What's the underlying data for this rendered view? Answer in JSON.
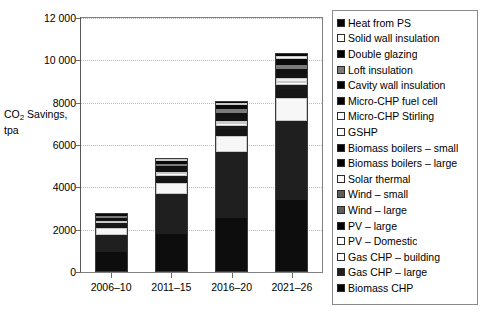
{
  "chart_data": {
    "type": "bar",
    "subtype": "stacked-bar",
    "title": "",
    "xlabel": "",
    "ylabel": "CO2 Savings, tpa",
    "ylabel_display": "CO₂ Savings,\ntpa",
    "ylim": [
      0,
      12000
    ],
    "yticks": [
      0,
      2000,
      4000,
      6000,
      8000,
      10000,
      12000
    ],
    "ytick_labels": [
      "0",
      "2000",
      "4000",
      "6000",
      "8000",
      "10 000",
      "12 000"
    ],
    "grid": true,
    "grid_axis": "y",
    "legend_position": "right",
    "categories": [
      "2006–10",
      "2011–15",
      "2016–20",
      "2021–26"
    ],
    "stack_order_bottom_to_top": [
      "Biomass CHP",
      "Gas CHP – large",
      "Gas CHP – building",
      "PV – Domestic",
      "PV – large",
      "Wind – large",
      "Wind – small",
      "Solar thermal",
      "Biomass boilers – large",
      "Biomass boilers – small",
      "GSHP",
      "Micro-CHP Stirling",
      "Micro-CHP fuel cell",
      "Cavity wall insulation",
      "Loft insulation",
      "Double glazing",
      "Solid wall insulation",
      "Heat from PS"
    ],
    "series": [
      {
        "name": "Biomass CHP",
        "color": "#0d0d0d",
        "values": [
          880,
          1750,
          2520,
          3340
        ]
      },
      {
        "name": "Gas CHP – large",
        "color": "#1f1f1f",
        "values": [
          840,
          1870,
          3100,
          3760
        ]
      },
      {
        "name": "Gas CHP – building",
        "color": "#f2f2f2",
        "values": [
          0,
          0,
          0,
          0
        ]
      },
      {
        "name": "PV – Domestic",
        "color": "#fbfbfb",
        "values": [
          0,
          0,
          0,
          0
        ]
      },
      {
        "name": "PV – large",
        "color": "#141414",
        "values": [
          0,
          0,
          0,
          0
        ]
      },
      {
        "name": "Wind – large",
        "color": "#5e5e5e",
        "values": [
          0,
          0,
          0,
          0
        ]
      },
      {
        "name": "Wind – small",
        "color": "#6b6b6b",
        "values": [
          0,
          0,
          0,
          0
        ]
      },
      {
        "name": "Solar thermal",
        "color": "#f7f7f7",
        "values": [
          320,
          520,
          760,
          1080
        ]
      },
      {
        "name": "Biomass boilers – large",
        "color": "#151515",
        "values": [
          150,
          260,
          330,
          430
        ]
      },
      {
        "name": "Biomass boilers – small",
        "color": "#191919",
        "values": [
          60,
          110,
          150,
          180
        ]
      },
      {
        "name": "GSHP",
        "color": "#fafafa",
        "values": [
          60,
          100,
          130,
          160
        ]
      },
      {
        "name": "Micro-CHP Stirling",
        "color": "#ededed",
        "values": [
          50,
          90,
          120,
          150
        ]
      },
      {
        "name": "Micro-CHP fuel cell",
        "color": "#121212",
        "values": [
          70,
          120,
          170,
          210
        ]
      },
      {
        "name": "Cavity wall insulation",
        "color": "#101010",
        "values": [
          90,
          140,
          200,
          250
        ]
      },
      {
        "name": "Loft insulation",
        "color": "#7a7a7a",
        "values": [
          70,
          110,
          160,
          200
        ]
      },
      {
        "name": "Double glazing",
        "color": "#0a0a0a",
        "values": [
          90,
          150,
          210,
          270
        ]
      },
      {
        "name": "Solid wall insulation",
        "color": "#f4f4f4",
        "values": [
          40,
          70,
          100,
          130
        ]
      },
      {
        "name": "Heat from PS",
        "color": "#080808",
        "values": [
          50,
          90,
          130,
          170
        ]
      }
    ],
    "totals": [
      2800,
      5380,
      8080,
      10330
    ],
    "annotations": []
  },
  "legend": {
    "items": [
      {
        "label": "Heat from PS",
        "swatch": "#000000"
      },
      {
        "label": "Solid wall insulation",
        "swatch": "#ffffff"
      },
      {
        "label": "Double glazing",
        "swatch": "#000000"
      },
      {
        "label": "Loft insulation",
        "swatch": "#7a7a7a"
      },
      {
        "label": "Cavity wall insulation",
        "swatch": "#000000"
      },
      {
        "label": "Micro-CHP fuel cell",
        "swatch": "#000000"
      },
      {
        "label": "Micro-CHP Stirling",
        "swatch": "#ffffff"
      },
      {
        "label": "GSHP",
        "swatch": "#ffffff"
      },
      {
        "label": "Biomass boilers – small",
        "swatch": "#000000"
      },
      {
        "label": "Biomass boilers – large",
        "swatch": "#000000"
      },
      {
        "label": "Solar thermal",
        "swatch": "#ffffff"
      },
      {
        "label": "Wind – small",
        "swatch": "#5e5e5e"
      },
      {
        "label": "Wind – large",
        "swatch": "#5e5e5e"
      },
      {
        "label": "PV – large",
        "swatch": "#000000"
      },
      {
        "label": "PV – Domestic",
        "swatch": "#ffffff"
      },
      {
        "label": "Gas CHP – building",
        "swatch": "#ffffff"
      },
      {
        "label": "Gas CHP – large",
        "swatch": "#1f1f1f"
      },
      {
        "label": "Biomass CHP",
        "swatch": "#000000"
      }
    ]
  },
  "axis": {
    "y_title_line1": "CO",
    "y_title_sub": "2",
    "y_title_line1b": " Savings,",
    "y_title_line2": "tpa"
  }
}
